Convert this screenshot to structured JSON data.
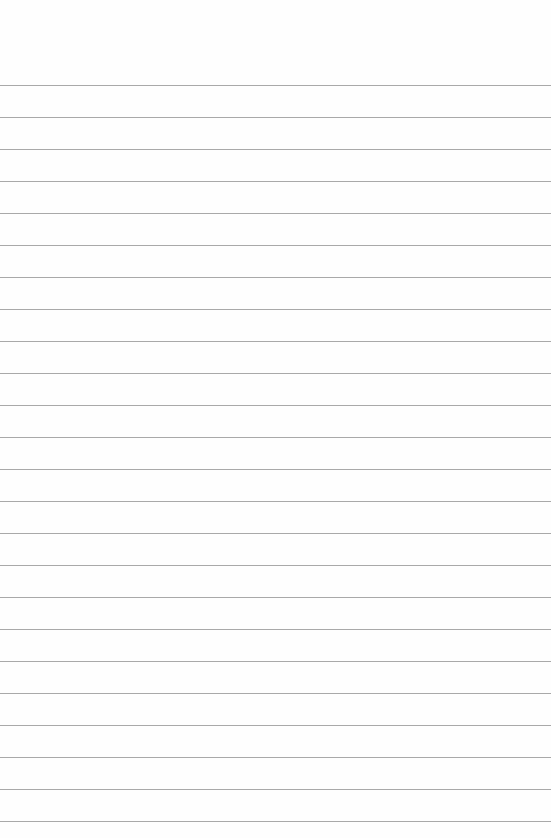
{
  "paper": {
    "type": "lined-paper",
    "background_color": "#fefefe",
    "line_color": "#a9a9a9",
    "first_line_y": 85,
    "line_spacing": 32,
    "line_count": 24
  }
}
